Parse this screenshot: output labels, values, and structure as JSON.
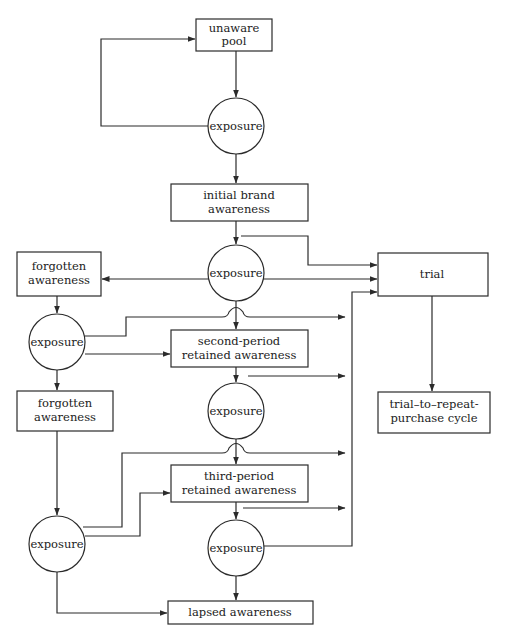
{
  "diagram": {
    "type": "flowchart",
    "nodes": {
      "unaware_pool": {
        "line1": "unaware",
        "line2": "pool"
      },
      "exposure_1": {
        "label": "exposure"
      },
      "initial_brand_awareness": {
        "line1": "initial brand",
        "line2": "awareness"
      },
      "exposure_2": {
        "label": "exposure"
      },
      "trial": {
        "label": "trial"
      },
      "forgotten_awareness_1": {
        "line1": "forgotten",
        "line2": "awareness"
      },
      "exposure_left_1": {
        "label": "exposure"
      },
      "second_period": {
        "line1": "second-period",
        "line2": "retained awareness"
      },
      "exposure_3": {
        "label": "exposure"
      },
      "trial_to_repeat": {
        "line1": "trial–to–repeat-",
        "line2": "purchase cycle"
      },
      "forgotten_awareness_2": {
        "line1": "forgotten",
        "line2": "awareness"
      },
      "third_period": {
        "line1": "third-period",
        "line2": "retained awareness"
      },
      "exposure_left_2": {
        "label": "exposure"
      },
      "exposure_4": {
        "label": "exposure"
      },
      "lapsed_awareness": {
        "label": "lapsed awareness"
      }
    },
    "edges": [
      {
        "from": "unaware_pool",
        "to": "exposure_1"
      },
      {
        "from": "exposure_1",
        "to": "unaware_pool"
      },
      {
        "from": "exposure_1",
        "to": "initial_brand_awareness"
      },
      {
        "from": "initial_brand_awareness",
        "to": "exposure_2"
      },
      {
        "from": "initial_brand_awareness",
        "to": "trial"
      },
      {
        "from": "exposure_2",
        "to": "trial"
      },
      {
        "from": "exposure_2",
        "to": "forgotten_awareness_1"
      },
      {
        "from": "exposure_2",
        "to": "second_period"
      },
      {
        "from": "forgotten_awareness_1",
        "to": "exposure_left_1"
      },
      {
        "from": "exposure_left_1",
        "to": "trial"
      },
      {
        "from": "exposure_left_1",
        "to": "second_period"
      },
      {
        "from": "exposure_left_1",
        "to": "forgotten_awareness_2"
      },
      {
        "from": "second_period",
        "to": "exposure_3"
      },
      {
        "from": "second_period",
        "to": "trial"
      },
      {
        "from": "exposure_3",
        "to": "trial"
      },
      {
        "from": "exposure_3",
        "to": "third_period"
      },
      {
        "from": "trial",
        "to": "trial_to_repeat"
      },
      {
        "from": "forgotten_awareness_2",
        "to": "exposure_left_2"
      },
      {
        "from": "exposure_left_2",
        "to": "trial"
      },
      {
        "from": "exposure_left_2",
        "to": "third_period"
      },
      {
        "from": "exposure_left_2",
        "to": "lapsed_awareness"
      },
      {
        "from": "third_period",
        "to": "exposure_4"
      },
      {
        "from": "third_period",
        "to": "trial"
      },
      {
        "from": "exposure_4",
        "to": "trial"
      },
      {
        "from": "exposure_4",
        "to": "lapsed_awareness"
      }
    ]
  },
  "colors": {
    "line": "#2b2b2b",
    "background": "#ffffff",
    "text": "#222222"
  }
}
